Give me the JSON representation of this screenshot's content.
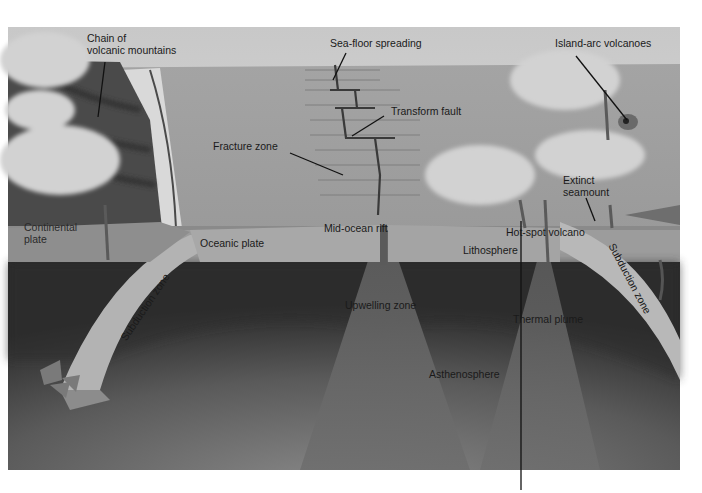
{
  "diagram": {
    "colors": {
      "background": "#ffffff",
      "sky": "#d4d4d4",
      "sea_surface": "#a9a9a9",
      "ocean_floor": "#9c9c9c",
      "lithosphere": "#9a9a9a",
      "oceanic_plate": "#a8a8a8",
      "subduction_band": "#b4b4b4",
      "asthenosphere_dark": "#2e2e2e",
      "asthenosphere_light": "#7a7a7a",
      "clouds": "#cfcfcf",
      "label_text": "#1a1a1a",
      "leader_line": "#111111"
    },
    "labels": {
      "chain_of_volcanic_mountains": [
        "Chain of",
        "volcanic mountains"
      ],
      "sea_floor_spreading": "Sea-floor spreading",
      "island_arc_volcanoes": "Island-arc volcanoes",
      "transform_fault": "Transform fault",
      "fracture_zone": "Fracture zone",
      "extinct_seamount": [
        "Extinct",
        "seamount"
      ],
      "continental_plate": [
        "Continental",
        "plate"
      ],
      "mid_ocean_rift": "Mid-ocean  rift",
      "oceanic_plate": "Oceanic plate",
      "hot_spot_volcano": "Hot-spot volcano",
      "lithosphere": "Lithosphere",
      "subduction_zone_left": "Subduction zone",
      "subduction_zone_right": "Subduction zone",
      "upwelling_zone": "Upwelling zone",
      "thermal_plume": "Thermal plume",
      "asthenosphere": "Asthenosphere"
    }
  }
}
